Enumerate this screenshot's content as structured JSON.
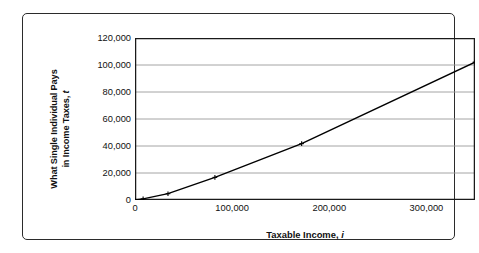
{
  "chart_data": {
    "type": "line",
    "title": "",
    "xlabel": "Taxable Income, i",
    "xlabel_text": "Taxable Income,",
    "xlabel_var": "i",
    "ylabel": "What Single Individual Pays in Income Taxes, t",
    "ylabel_line1": "What Single Individual Pays",
    "ylabel_line2": "in Income Taxes,",
    "ylabel_var": "t",
    "xlim": [
      0,
      350000
    ],
    "ylim": [
      0,
      120000
    ],
    "xticks": [
      0,
      100000,
      200000,
      300000
    ],
    "xtick_labels": [
      "0",
      "100,000",
      "200,000",
      "300,000"
    ],
    "yticks": [
      0,
      20000,
      40000,
      60000,
      80000,
      100000,
      120000
    ],
    "ytick_labels": [
      "0",
      "20,000",
      "40,000",
      "60,000",
      "80,000",
      "100,000",
      "120,000"
    ],
    "grid": "horizontal",
    "legend": "none",
    "marker": "cross",
    "line_color": "#000000",
    "grid_color": "#9a9a9a",
    "axis_color": "#1a1a1a",
    "series": [
      {
        "name": "Income tax owed",
        "x": [
          0,
          8350,
          33950,
          82250,
          171550,
          350000
        ],
        "y": [
          0,
          835,
          4675,
          16750,
          41754,
          102139
        ]
      }
    ],
    "points": [
      {
        "x": 0,
        "y": 0
      },
      {
        "x": 8350,
        "y": 835
      },
      {
        "x": 33950,
        "y": 4675
      },
      {
        "x": 82250,
        "y": 16750
      },
      {
        "x": 171550,
        "y": 41754
      },
      {
        "x": 350000,
        "y": 102139
      }
    ]
  }
}
